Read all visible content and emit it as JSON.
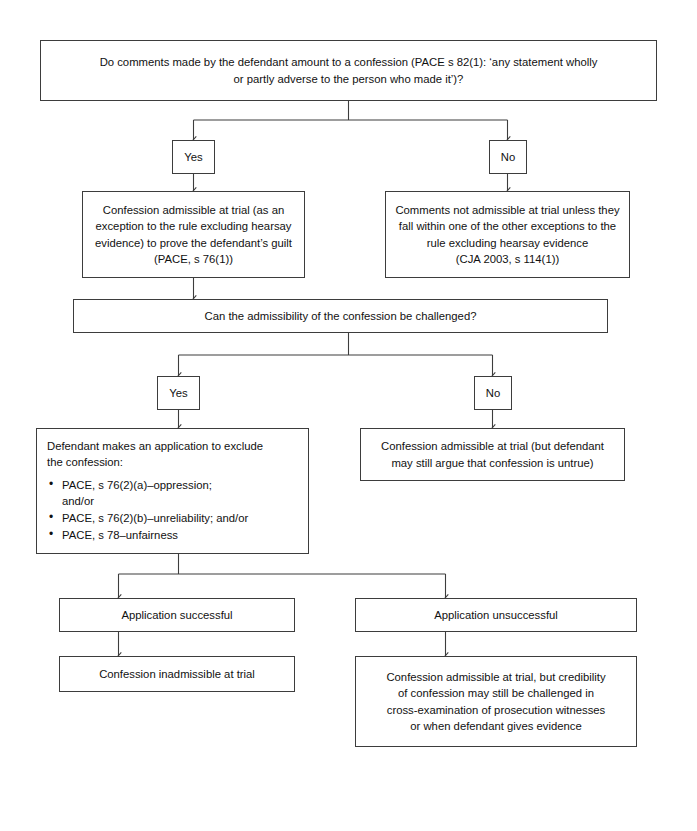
{
  "diagram": {
    "line_color": "#3d3d3d",
    "background_color": "#ffffff",
    "text_color": "#111111"
  },
  "nodes": {
    "q1": {
      "line1": "Do comments made by the defendant amount to a confession (PACE s 82(1): ‘any statement wholly",
      "line2": "or partly adverse to the person who made it’)?"
    },
    "q1_yes": {
      "label": "Yes"
    },
    "q1_no": {
      "label": "No"
    },
    "admissible_exception": {
      "line1": "Confession admissible at trial (as an",
      "line2": "exception to the rule excluding hearsay",
      "line3": "evidence) to prove the defendant’s guilt",
      "line4": "(PACE, s 76(1))"
    },
    "not_admissible": {
      "line1": "Comments not admissible at trial unless they",
      "line2": "fall within one of the other exceptions to the",
      "line3": "rule excluding hearsay evidence",
      "line4": "(CJA 2003, s 114(1))"
    },
    "q2": {
      "line1": "Can the admissibility of the confession be challenged?"
    },
    "q2_yes": {
      "label": "Yes"
    },
    "q2_no": {
      "label": "No"
    },
    "application": {
      "line1": "Defendant makes an application to exclude",
      "line2": "the confession:",
      "bullets": [
        {
          "main": "PACE, s 76(2)(a)–oppression;",
          "sub": "and/or"
        },
        {
          "main": "PACE, s 76(2)(b)–unreliability; and/or",
          "sub": ""
        },
        {
          "main": "PACE, s 78–unfairness",
          "sub": ""
        }
      ]
    },
    "admissible_untrue": {
      "line1": "Confession admissible at trial (but defendant",
      "line2": "may still argue that confession is untrue)"
    },
    "app_successful": {
      "label": "Application successful"
    },
    "app_unsuccessful": {
      "label": "Application unsuccessful"
    },
    "inadmissible": {
      "label": "Confession inadmissible at trial"
    },
    "credibility": {
      "line1": "Confession admissible at trial, but credibility",
      "line2": "of confession may still be challenged in",
      "line3": "cross-examination of prosecution witnesses",
      "line4": "or when defendant gives evidence"
    }
  }
}
